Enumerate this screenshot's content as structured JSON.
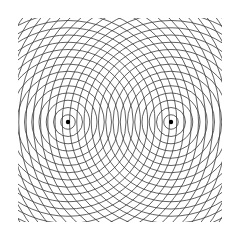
{
  "figure": {
    "title": "Two-source circular wavefront interference pattern",
    "type": "two-source-wave-interference",
    "canvas_width": 236,
    "canvas_height": 241,
    "background_color": "#ffffff",
    "line_color": "#3a3a3a",
    "line_width": 0.8,
    "marker_color": "#000000",
    "marker_radius": 2.2
  },
  "clip_region": {
    "shape": "rectangle",
    "x": 18,
    "y": 18,
    "width": 204,
    "height": 204,
    "border": "none"
  },
  "sources": [
    {
      "id": "source-left",
      "label": "S1",
      "cx": 68,
      "cy": 122,
      "ring_spacing": 7.25,
      "ring_count": 26,
      "first_ring_radius": 7.25
    },
    {
      "id": "source-right",
      "label": "S2",
      "cx": 171,
      "cy": 122,
      "ring_spacing": 7.25,
      "ring_count": 26,
      "first_ring_radius": 7.25
    }
  ],
  "geometry": {
    "source_separation": 103,
    "wavelength": 7.25,
    "separation_in_wavelengths": 14.2
  },
  "chart_data": {
    "type": "diagram",
    "title": "Two-source circular wavefront interference pattern",
    "series": [
      {
        "name": "Source 1 wavefronts",
        "center": [
          68,
          122
        ],
        "radii": [
          7.25,
          14.5,
          21.75,
          29,
          36.25,
          43.5,
          50.75,
          58,
          65.25,
          72.5,
          79.75,
          87,
          94.25,
          101.5,
          108.75,
          116,
          123.25,
          130.5,
          137.75,
          145,
          152.25,
          159.5,
          166.75,
          174,
          181.25,
          188.5
        ]
      },
      {
        "name": "Source 2 wavefronts",
        "center": [
          171,
          122
        ],
        "radii": [
          7.25,
          14.5,
          21.75,
          29,
          36.25,
          43.5,
          50.75,
          58,
          65.25,
          72.5,
          79.75,
          87,
          94.25,
          101.5,
          108.75,
          116,
          123.25,
          130.5,
          137.75,
          145,
          152.25,
          159.5,
          166.75,
          174,
          181.25,
          188.5
        ]
      }
    ],
    "markers": [
      {
        "name": "Source 1",
        "x": 68,
        "y": 122
      },
      {
        "name": "Source 2",
        "x": 171,
        "y": 122
      }
    ],
    "xlabel": "",
    "ylabel": "",
    "grid": false,
    "legend": "none"
  }
}
